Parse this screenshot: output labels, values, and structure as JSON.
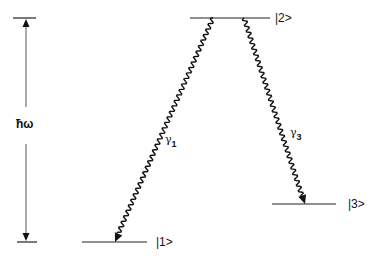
{
  "diagram": {
    "type": "energy-level-diagram",
    "energy_gap_label": "ħω",
    "levels": [
      {
        "id": "1",
        "label": "|1>"
      },
      {
        "id": "2",
        "label": "|2>"
      },
      {
        "id": "3",
        "label": "|3>"
      }
    ],
    "transitions": [
      {
        "from": "2",
        "to": "1",
        "symbol": "γ",
        "subscript": "1",
        "style": "wavy-arrow"
      },
      {
        "from": "2",
        "to": "3",
        "symbol": "γ",
        "subscript": "3",
        "style": "wavy-arrow"
      }
    ],
    "colors": {
      "line": "#111111",
      "background": "#ffffff"
    }
  }
}
